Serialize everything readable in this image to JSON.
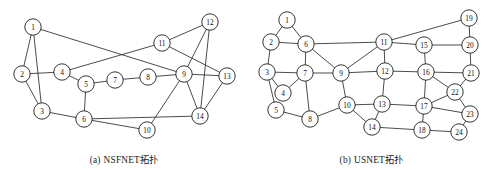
{
  "figure": {
    "panels": [
      {
        "id": "nsfnet",
        "caption_index": "(a)",
        "caption_text": "NSFNET拓扑",
        "node_radius": 8.2,
        "nodes": [
          {
            "id": 1,
            "label": "1",
            "x": 33,
            "y": 27
          },
          {
            "id": 2,
            "label": "2",
            "x": 22,
            "y": 74
          },
          {
            "id": 3,
            "label": "3",
            "x": 42,
            "y": 111
          },
          {
            "id": 4,
            "label": "4",
            "x": 62,
            "y": 72
          },
          {
            "id": 5,
            "label": "5",
            "x": 86,
            "y": 84
          },
          {
            "id": 6,
            "label": "6",
            "x": 84,
            "y": 119
          },
          {
            "id": 7,
            "label": "7",
            "x": 115,
            "y": 80
          },
          {
            "id": 8,
            "label": "8",
            "x": 148,
            "y": 77
          },
          {
            "id": 9,
            "label": "9",
            "x": 184,
            "y": 74
          },
          {
            "id": 10,
            "label": "10",
            "x": 147,
            "y": 130
          },
          {
            "id": 11,
            "label": "11",
            "x": 162,
            "y": 43
          },
          {
            "id": 12,
            "label": "12",
            "x": 210,
            "y": 22
          },
          {
            "id": 13,
            "label": "13",
            "x": 227,
            "y": 76
          },
          {
            "id": 14,
            "label": "14",
            "x": 200,
            "y": 116
          }
        ],
        "edges": [
          [
            1,
            2
          ],
          [
            1,
            3
          ],
          [
            1,
            9
          ],
          [
            2,
            3
          ],
          [
            2,
            4
          ],
          [
            3,
            6
          ],
          [
            4,
            5
          ],
          [
            4,
            11
          ],
          [
            5,
            6
          ],
          [
            5,
            7
          ],
          [
            6,
            10
          ],
          [
            6,
            14
          ],
          [
            7,
            8
          ],
          [
            8,
            9
          ],
          [
            9,
            10
          ],
          [
            9,
            12
          ],
          [
            9,
            13
          ],
          [
            9,
            14
          ],
          [
            11,
            12
          ],
          [
            11,
            13
          ],
          [
            12,
            14
          ],
          [
            13,
            14
          ]
        ]
      },
      {
        "id": "usnet",
        "caption_index": "(b)",
        "caption_text": "USNET拓扑",
        "node_radius": 8.2,
        "nodes": [
          {
            "id": 1,
            "label": "1",
            "x": 39,
            "y": 20
          },
          {
            "id": 2,
            "label": "2",
            "x": 23,
            "y": 42
          },
          {
            "id": 3,
            "label": "3",
            "x": 19,
            "y": 72
          },
          {
            "id": 4,
            "label": "4",
            "x": 35,
            "y": 93
          },
          {
            "id": 5,
            "label": "5",
            "x": 28,
            "y": 110
          },
          {
            "id": 6,
            "label": "6",
            "x": 58,
            "y": 44
          },
          {
            "id": 7,
            "label": "7",
            "x": 57,
            "y": 73
          },
          {
            "id": 8,
            "label": "8",
            "x": 62,
            "y": 119
          },
          {
            "id": 9,
            "label": "9",
            "x": 93,
            "y": 73
          },
          {
            "id": 10,
            "label": "10",
            "x": 99,
            "y": 105
          },
          {
            "id": 11,
            "label": "11",
            "x": 136,
            "y": 42
          },
          {
            "id": 12,
            "label": "12",
            "x": 137,
            "y": 71
          },
          {
            "id": 13,
            "label": "13",
            "x": 134,
            "y": 104
          },
          {
            "id": 14,
            "label": "14",
            "x": 124,
            "y": 127
          },
          {
            "id": 15,
            "label": "15",
            "x": 176,
            "y": 45
          },
          {
            "id": 16,
            "label": "16",
            "x": 178,
            "y": 72
          },
          {
            "id": 17,
            "label": "17",
            "x": 176,
            "y": 106
          },
          {
            "id": 18,
            "label": "18",
            "x": 174,
            "y": 130
          },
          {
            "id": 19,
            "label": "19",
            "x": 221,
            "y": 18
          },
          {
            "id": 20,
            "label": "20",
            "x": 222,
            "y": 45
          },
          {
            "id": 21,
            "label": "21",
            "x": 223,
            "y": 73
          },
          {
            "id": 22,
            "label": "22",
            "x": 207,
            "y": 92
          },
          {
            "id": 23,
            "label": "23",
            "x": 222,
            "y": 114
          },
          {
            "id": 24,
            "label": "24",
            "x": 211,
            "y": 132
          }
        ],
        "edges": [
          [
            1,
            2
          ],
          [
            1,
            6
          ],
          [
            2,
            3
          ],
          [
            2,
            6
          ],
          [
            3,
            4
          ],
          [
            3,
            5
          ],
          [
            3,
            7
          ],
          [
            4,
            7
          ],
          [
            5,
            8
          ],
          [
            6,
            7
          ],
          [
            6,
            9
          ],
          [
            6,
            11
          ],
          [
            7,
            8
          ],
          [
            7,
            9
          ],
          [
            8,
            10
          ],
          [
            9,
            10
          ],
          [
            9,
            11
          ],
          [
            9,
            12
          ],
          [
            10,
            13
          ],
          [
            10,
            14
          ],
          [
            11,
            12
          ],
          [
            11,
            15
          ],
          [
            11,
            19
          ],
          [
            12,
            13
          ],
          [
            12,
            16
          ],
          [
            13,
            14
          ],
          [
            13,
            17
          ],
          [
            14,
            18
          ],
          [
            15,
            16
          ],
          [
            15,
            20
          ],
          [
            16,
            17
          ],
          [
            16,
            21
          ],
          [
            16,
            22
          ],
          [
            17,
            18
          ],
          [
            17,
            22
          ],
          [
            17,
            23
          ],
          [
            18,
            24
          ],
          [
            19,
            20
          ],
          [
            20,
            21
          ],
          [
            21,
            22
          ],
          [
            22,
            23
          ],
          [
            23,
            24
          ]
        ]
      }
    ]
  }
}
